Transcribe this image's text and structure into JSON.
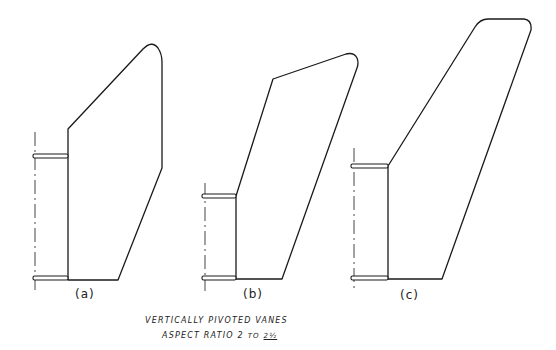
{
  "vanes": [
    {
      "id": "a",
      "label": "(a)"
    },
    {
      "id": "b",
      "label": "(b)"
    },
    {
      "id": "c",
      "label": "(c)"
    }
  ],
  "caption": {
    "line1": "VERTICALLY PIVOTED VANES",
    "line2_prefix": "ASPECT RATIO 2",
    "line2_to": "TO",
    "line2_value": "2½"
  },
  "colors": {
    "ink": "#1a1a1a",
    "background": "#ffffff"
  }
}
